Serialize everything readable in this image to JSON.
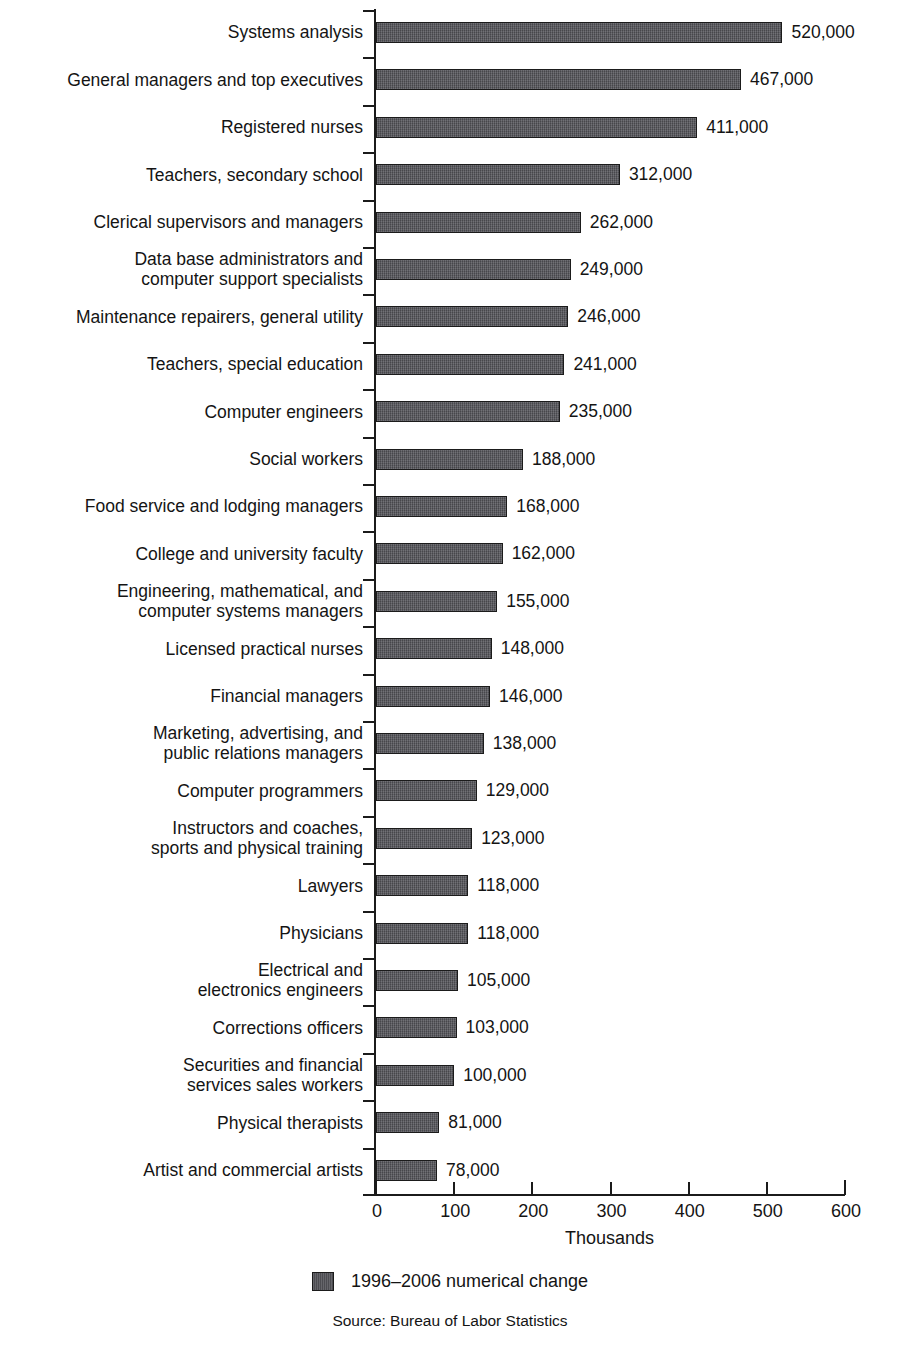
{
  "figure": {
    "cropped_title_remnant": "",
    "source_note": "Source: Bureau of Labor Statistics",
    "value_suffix": ",000",
    "bar_color": "#55555a",
    "bar_border_color": "#1b1b1b",
    "axis_color": "#1b1b1b",
    "text_color": "#141414"
  },
  "legend": {
    "position": "bottom-center",
    "entries": [
      {
        "label": "1996–2006 numerical change",
        "color": "#55555a"
      }
    ]
  },
  "axis": {
    "xlabel": "Thousands",
    "xticks": [
      "0",
      "100",
      "200",
      "300",
      "400",
      "500",
      "600"
    ],
    "xlim": [
      0,
      600
    ],
    "grid": false
  },
  "chart_data": {
    "type": "bar",
    "orientation": "horizontal",
    "title": "",
    "subtitle": "",
    "xlabel": "Thousands",
    "ylabel": "",
    "xlim": [
      0,
      600
    ],
    "xticks": [
      0,
      100,
      200,
      300,
      400,
      500,
      600
    ],
    "grid": false,
    "legend_position": "bottom-center",
    "series_name": "1996–2006 numerical change",
    "units": "thousands",
    "value_label_format": "{value},000",
    "categories": [
      "Systems analysis",
      "General managers and top executives",
      "Registered nurses",
      "Teachers, secondary school",
      "Clerical supervisors and managers",
      "Data base administrators and\ncomputer support specialists",
      "Maintenance repairers, general utility",
      "Teachers, special education",
      "Computer engineers",
      "Social workers",
      "Food service and lodging managers",
      "College and university faculty",
      "Engineering, mathematical, and\ncomputer systems managers",
      "Licensed practical nurses",
      "Financial managers",
      "Marketing, advertising, and\npublic relations managers",
      "Computer programmers",
      "Instructors and coaches,\nsports and physical training",
      "Lawyers",
      "Physicians",
      "Electrical and\nelectronics engineers",
      "Corrections officers",
      "Securities and financial\nservices sales workers",
      "Physical therapists",
      "Artist and commercial artists"
    ],
    "values": [
      520,
      467,
      411,
      312,
      262,
      249,
      246,
      241,
      235,
      188,
      168,
      162,
      155,
      148,
      146,
      138,
      129,
      123,
      118,
      118,
      105,
      103,
      100,
      81,
      78
    ],
    "value_labels": [
      "520,000",
      "467,000",
      "411,000",
      "312,000",
      "262,000",
      "249,000",
      "246,000",
      "241,000",
      "235,000",
      "188,000",
      "168,000",
      "162,000",
      "155,000",
      "148,000",
      "146,000",
      "138,000",
      "129,000",
      "123,000",
      "118,000",
      "118,000",
      "105,000",
      "103,000",
      "100,000",
      "81,000",
      "78,000"
    ]
  }
}
